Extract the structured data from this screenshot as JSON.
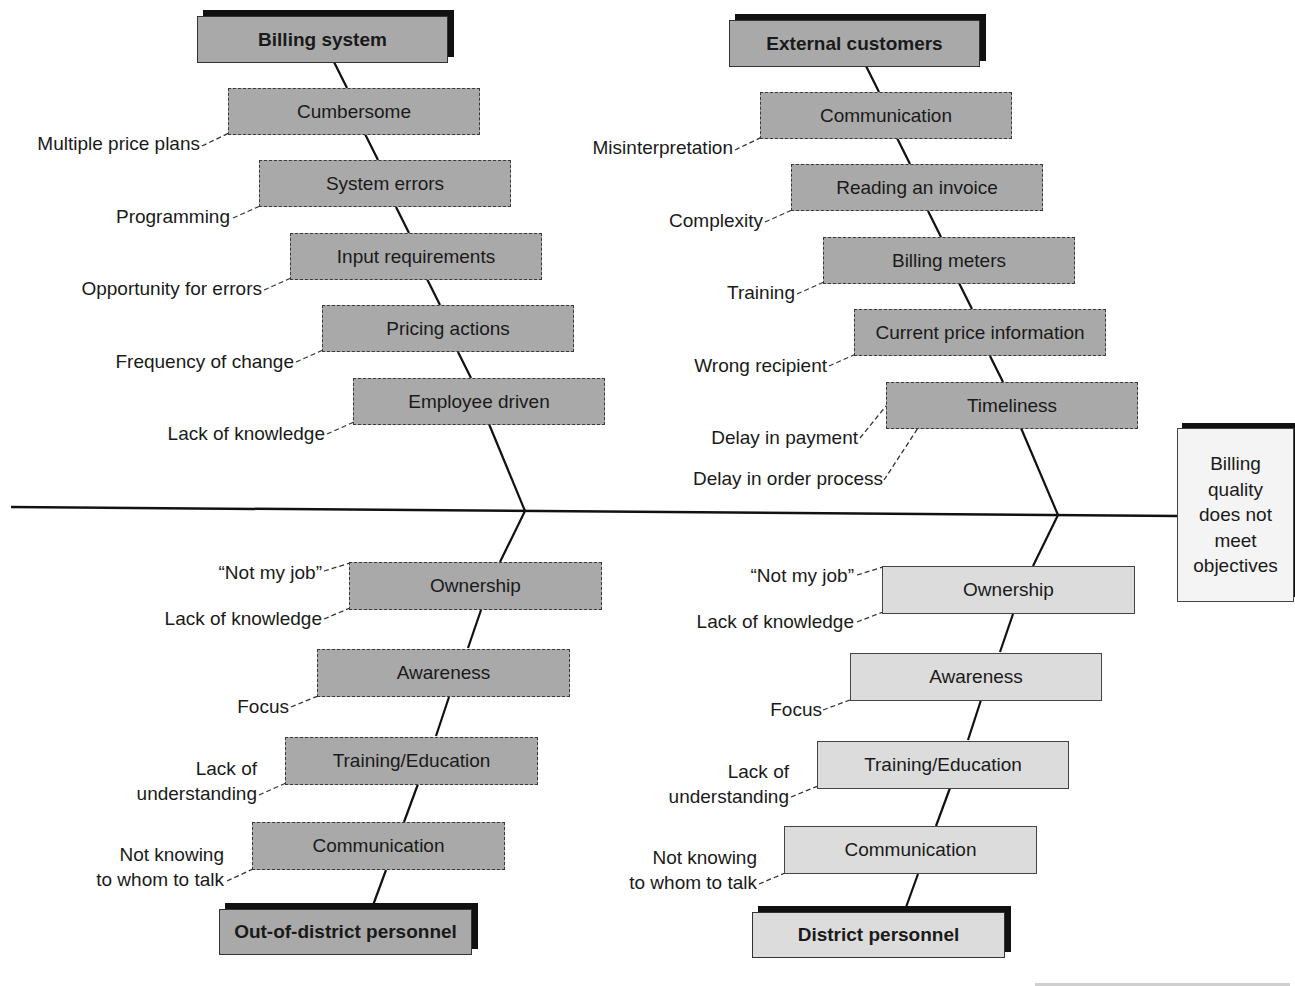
{
  "effect": "Billing quality does not meet objectives",
  "colors": {
    "dark_box": "#a9a9a9",
    "light_box": "#dcdcdc",
    "line": "#111111"
  },
  "categories": {
    "billing_system": {
      "title": "Billing system",
      "causes": [
        "Cumbersome",
        "System errors",
        "Input requirements",
        "Pricing actions",
        "Employee driven"
      ],
      "subcauses": [
        "Multiple price plans",
        "Programming",
        "Opportunity for errors",
        "Frequency of change",
        "Lack of knowledge"
      ]
    },
    "external_customers": {
      "title": "External customers",
      "causes": [
        "Communication",
        "Reading an invoice",
        "Billing meters",
        "Current price information",
        "Timeliness"
      ],
      "subcauses": [
        "Misinterpretation",
        "Complexity",
        "Training",
        "Wrong recipient",
        "Delay in payment",
        "Delay in order process"
      ]
    },
    "out_of_district": {
      "title": "Out-of-district personnel",
      "causes": [
        "Ownership",
        "Awareness",
        "Training/Education",
        "Communication"
      ],
      "subcauses": [
        "“Not my job”",
        "Lack of knowledge",
        "Focus",
        "Lack of",
        "understanding",
        "Not knowing",
        "to whom to talk"
      ]
    },
    "district": {
      "title": "District personnel",
      "causes": [
        "Ownership",
        "Awareness",
        "Training/Education",
        "Communication"
      ],
      "subcauses": [
        "“Not my job”",
        "Lack of knowledge",
        "Focus",
        "Lack of",
        "understanding",
        "Not knowing",
        "to whom to talk"
      ]
    }
  }
}
